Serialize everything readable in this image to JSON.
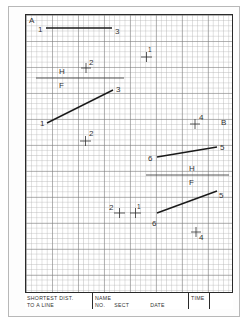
{
  "sheet": {
    "sheet_label_a": "A",
    "sheet_label_b": "B",
    "colors": {
      "ink": "#222222",
      "grid_minor": "#c8c8c8",
      "grid_major": "#8a8a8a",
      "border": "#2a2a2a"
    }
  },
  "problem_a": {
    "top_view": {
      "line": {
        "from_label": "1",
        "to_label": "3"
      },
      "point_label": "2"
    },
    "fold_line": {
      "upper_label": "H",
      "lower_label": "F"
    },
    "front_view": {
      "line": {
        "from_label": "1",
        "to_label": "3"
      },
      "point_label": "2"
    },
    "free_point_label": "1"
  },
  "problem_b": {
    "top_view": {
      "line": {
        "from_label": "6",
        "to_label": "5"
      },
      "point_label": "4"
    },
    "fold_line": {
      "upper_label": "H",
      "lower_label": "F"
    },
    "front_view": {
      "line": {
        "from_label": "6",
        "to_label": "5"
      },
      "point_label": "4"
    },
    "extra_points": [
      {
        "label": "2"
      },
      {
        "label": "1"
      }
    ]
  },
  "title_block": {
    "title_line1": "SHORTEST DIST.",
    "title_line2": "TO A LINE",
    "name_label": "NAME",
    "no_label": "NO.",
    "sect_label": "SECT",
    "date_label": "DATE",
    "time_label": "TIME"
  }
}
